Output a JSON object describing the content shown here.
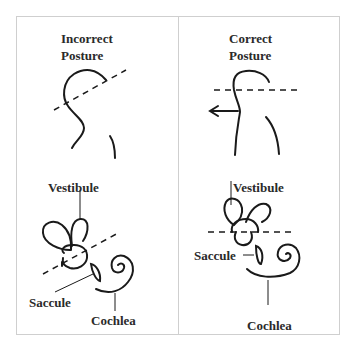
{
  "panels": [
    {
      "title_line1": "Incorrect",
      "title_line2": "Posture",
      "labels": {
        "vestibule": "Vestibule",
        "saccule": "Saccule",
        "cochlea": "Cochlea"
      }
    },
    {
      "title_line1": "Correct",
      "title_line2": "Posture",
      "labels": {
        "vestibule": "Vestibule",
        "saccule": "Saccule",
        "cochlea": "Cochlea"
      }
    }
  ],
  "colors": {
    "ink": "#1a1a1a",
    "frame": "#cfcfcf",
    "background": "#ffffff"
  }
}
